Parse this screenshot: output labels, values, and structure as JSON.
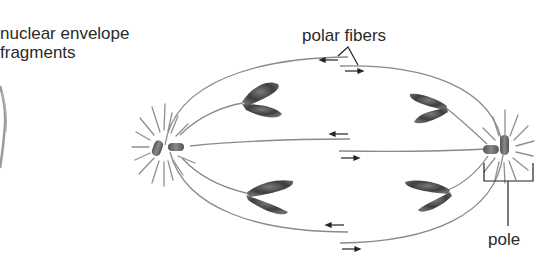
{
  "figure": {
    "labels": {
      "nuclear_envelope_line1": "nuclear envelope",
      "nuclear_envelope_line2": "fragments",
      "polar_fibers": "polar fibers",
      "pole": "pole"
    },
    "structures": [
      {
        "name": "left-pole",
        "type": "centrosome with centriole pair and aster"
      },
      {
        "name": "right-pole",
        "type": "centrosome with centriole pair and aster"
      },
      {
        "name": "chromosome-upper-left",
        "type": "sister chromatid pair"
      },
      {
        "name": "chromosome-upper-right",
        "type": "sister chromatid pair"
      },
      {
        "name": "chromosome-lower-left",
        "type": "sister chromatid pair"
      },
      {
        "name": "chromosome-lower-right",
        "type": "sister chromatid pair"
      },
      {
        "name": "polar-fiber-overlap-top",
        "arrows": [
          "left",
          "right"
        ]
      },
      {
        "name": "polar-fiber-overlap-middle",
        "arrows": [
          "left",
          "right"
        ]
      },
      {
        "name": "polar-fiber-overlap-bottom",
        "arrows": [
          "left",
          "right"
        ]
      },
      {
        "name": "nuclear-envelope-fragment",
        "type": "partial curved membrane at left edge"
      }
    ],
    "colors": {
      "fiber": "#8a8a8a",
      "chromatid": "#4a4a4a",
      "text": "#2a2a2a",
      "arrow": "#222222"
    }
  }
}
